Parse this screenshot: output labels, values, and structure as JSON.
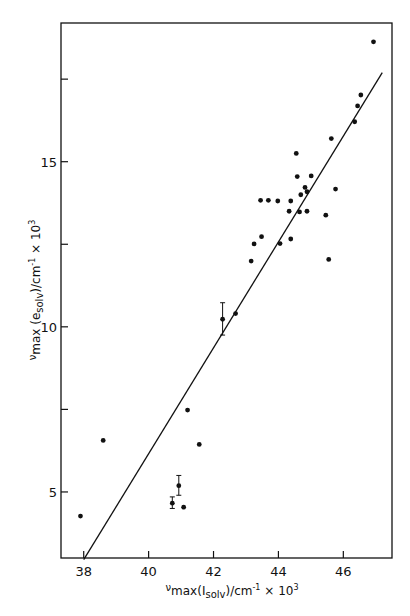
{
  "chart_data": {
    "type": "scatter",
    "title": "",
    "xlabel": "νmax(Isolv)/cm⁻¹ × 10³",
    "ylabel": "νmax(esolv)/cm⁻¹ × 10³",
    "xlim": [
      37.3,
      47.5
    ],
    "ylim": [
      3.0,
      19.2
    ],
    "grid": false,
    "legend": null,
    "x_ticks": [
      38,
      40,
      42,
      44,
      46
    ],
    "x_tick_labels": [
      "38",
      "40",
      "42",
      "44",
      "46"
    ],
    "y_ticks": [
      5,
      7.5,
      10,
      12.5,
      15,
      17.5
    ],
    "y_tick_labels": [
      "5",
      "",
      "10",
      "",
      "15",
      ""
    ],
    "series": [
      {
        "name": "data",
        "points": [
          {
            "x": 37.9,
            "y": 4.27
          },
          {
            "x": 38.6,
            "y": 6.56
          },
          {
            "x": 41.2,
            "y": 7.48
          },
          {
            "x": 41.56,
            "y": 6.44
          },
          {
            "x": 40.93,
            "y": 5.19,
            "err": [
              4.9,
              5.5
            ]
          },
          {
            "x": 40.73,
            "y": 4.66,
            "err": [
              4.5,
              4.85
            ]
          },
          {
            "x": 41.08,
            "y": 4.54
          },
          {
            "x": 42.28,
            "y": 10.23,
            "err": [
              9.75,
              10.73
            ]
          },
          {
            "x": 42.68,
            "y": 10.4
          },
          {
            "x": 43.16,
            "y": 11.99
          },
          {
            "x": 43.25,
            "y": 12.51
          },
          {
            "x": 43.48,
            "y": 12.73
          },
          {
            "x": 44.05,
            "y": 12.52
          },
          {
            "x": 44.38,
            "y": 12.66
          },
          {
            "x": 43.45,
            "y": 13.83
          },
          {
            "x": 43.69,
            "y": 13.83
          },
          {
            "x": 43.98,
            "y": 13.81
          },
          {
            "x": 44.38,
            "y": 13.81
          },
          {
            "x": 44.33,
            "y": 13.5
          },
          {
            "x": 44.65,
            "y": 13.48
          },
          {
            "x": 44.88,
            "y": 13.5
          },
          {
            "x": 45.46,
            "y": 13.38
          },
          {
            "x": 45.55,
            "y": 12.04
          },
          {
            "x": 44.69,
            "y": 14.0
          },
          {
            "x": 44.88,
            "y": 14.09
          },
          {
            "x": 44.82,
            "y": 14.22
          },
          {
            "x": 45.76,
            "y": 14.17
          },
          {
            "x": 44.58,
            "y": 14.55
          },
          {
            "x": 45.01,
            "y": 14.57
          },
          {
            "x": 44.55,
            "y": 15.25
          },
          {
            "x": 45.63,
            "y": 15.7
          },
          {
            "x": 46.35,
            "y": 16.21
          },
          {
            "x": 46.44,
            "y": 16.69
          },
          {
            "x": 46.54,
            "y": 17.02
          },
          {
            "x": 46.93,
            "y": 18.63
          }
        ]
      }
    ],
    "fit_line": {
      "x1": 38.0,
      "y1": 2.95,
      "x2": 47.2,
      "y2": 17.7
    }
  },
  "labels": {
    "x_nu": "ν",
    "x_main": "max(I",
    "x_sub": "solv",
    "x_rest": ")/cm",
    "x_exp": "-1",
    "x_times": " × 10",
    "x_exp3": "3",
    "y_nu": "ν",
    "y_main": "max (e",
    "y_sub": "solv",
    "y_rest": ")/cm",
    "y_exp": "-1",
    "y_times": " × 10",
    "y_exp3": "3"
  }
}
